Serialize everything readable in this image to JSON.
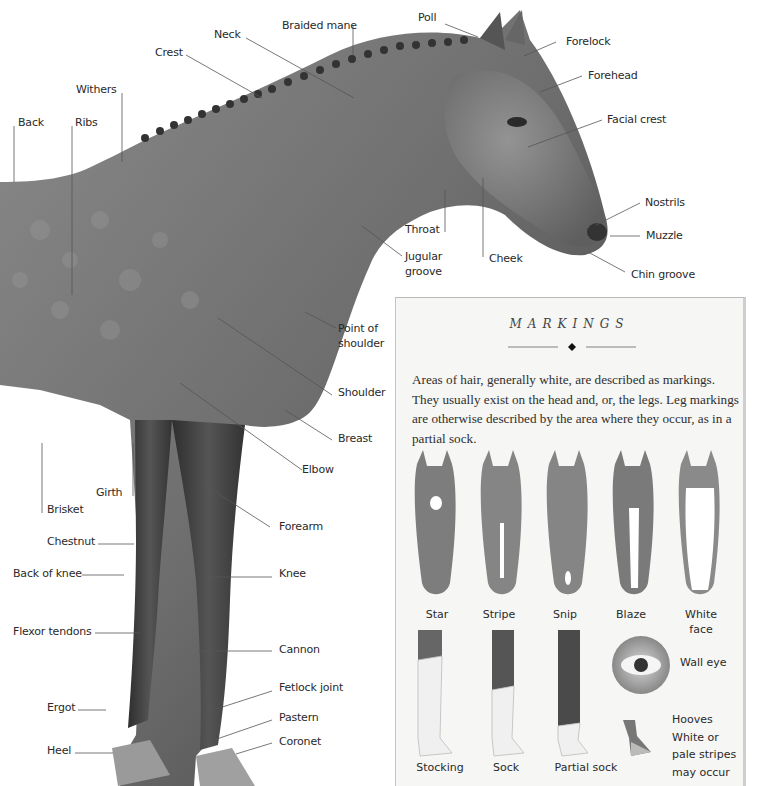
{
  "diagram": {
    "labels": {
      "poll": "Poll",
      "braided_mane": "Braided mane",
      "neck": "Neck",
      "crest": "Crest",
      "withers": "Withers",
      "back": "Back",
      "ribs": "Ribs",
      "forelock": "Forelock",
      "forehead": "Forehead",
      "facial_crest": "Facial crest",
      "nostrils": "Nostrils",
      "muzzle": "Muzzle",
      "chin_groove": "Chin groove",
      "throat": "Throat",
      "jugular_groove": "Jugular groove",
      "cheek": "Cheek",
      "point_of_shoulder": "Point of shoulder",
      "shoulder": "Shoulder",
      "breast": "Breast",
      "elbow": "Elbow",
      "girth": "Girth",
      "brisket": "Brisket",
      "forearm": "Forearm",
      "chestnut": "Chestnut",
      "back_of_knee": "Back of knee",
      "knee": "Knee",
      "flexor_tendons": "Flexor tendons",
      "cannon": "Cannon",
      "fetlock_joint": "Fetlock joint",
      "ergot": "Ergot",
      "pastern": "Pastern",
      "heel": "Heel",
      "coronet": "Coronet"
    }
  },
  "markings_panel": {
    "title": "MARKINGS",
    "ornament": "diamond-rule",
    "description": "Areas of hair, generally white, are described as markings. They usually exist on the head and, or, the legs. Leg markings are otherwise described by the area where they occur, as in a partial sock.",
    "head_markings": [
      {
        "label": "Star"
      },
      {
        "label": "Stripe"
      },
      {
        "label": "Snip"
      },
      {
        "label": "Blaze"
      },
      {
        "label": "White face"
      }
    ],
    "leg_markings": [
      {
        "label": "Stocking"
      },
      {
        "label": "Sock"
      },
      {
        "label": "Partial sock"
      }
    ],
    "eye": {
      "label": "Wall eye"
    },
    "hooves": {
      "label": "Hooves White or pale stripes may occur"
    }
  }
}
